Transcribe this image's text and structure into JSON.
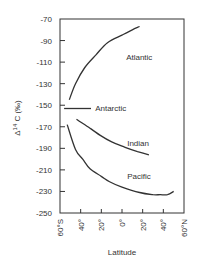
{
  "chart_data": {
    "type": "line",
    "title": "",
    "xlabel": "Latitude",
    "ylabel": "Δ14 C (‰)",
    "ylabel_parts": {
      "prefix": "Δ",
      "sup": "14",
      "suffix": " C (‰)"
    },
    "xlim": [
      -60,
      60
    ],
    "ylim": [
      -250,
      -70
    ],
    "x_ticks": [
      -60,
      -40,
      -20,
      0,
      20,
      40,
      60
    ],
    "x_tick_labels": [
      "60°S",
      "40°",
      "20°",
      "0°",
      "20°",
      "40°",
      "60°N"
    ],
    "y_ticks": [
      -70,
      -90,
      -110,
      -130,
      -150,
      -170,
      -190,
      -210,
      -230,
      -250
    ],
    "y_tick_labels": [
      "-70",
      "-90",
      "-110",
      "-130",
      "-150",
      "-170",
      "-190",
      "-210",
      "-230",
      "-250"
    ],
    "grid": false,
    "legend": "inline labels",
    "series": [
      {
        "name": "Atlantic",
        "x": [
          -51,
          -45,
          -36,
          -25,
          -14,
          0,
          10,
          17
        ],
        "y": [
          -145,
          -130,
          -115,
          -103,
          -92,
          -85,
          -80,
          -77
        ],
        "label_pos": {
          "x": 4,
          "y": -105
        }
      },
      {
        "name": "Antarctic",
        "x": [
          -56,
          -30
        ],
        "y": [
          -153,
          -153
        ],
        "label_pos": {
          "x": -26,
          "y": -153
        }
      },
      {
        "name": "Indian",
        "x": [
          -44,
          -30,
          -21,
          -10,
          3,
          15,
          26
        ],
        "y": [
          -163,
          -172,
          -178,
          -184,
          -189,
          -193,
          -196
        ],
        "label_pos": {
          "x": 5,
          "y": -185
        }
      },
      {
        "name": "Pacific",
        "x": [
          -53,
          -45,
          -38,
          -31,
          -20,
          -12,
          0,
          17,
          30,
          37,
          44,
          50
        ],
        "y": [
          -168,
          -191,
          -200,
          -209,
          -216,
          -221,
          -226,
          -231,
          -233,
          -233,
          -233,
          -230
        ],
        "label_pos": {
          "x": 5,
          "y": -216
        }
      }
    ]
  }
}
